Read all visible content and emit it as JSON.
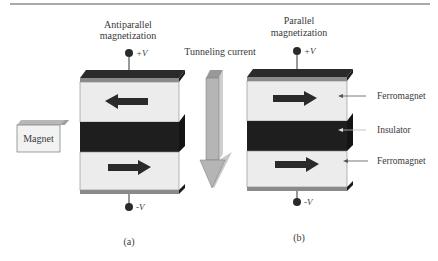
{
  "figure": {
    "panel_a": {
      "title_line1": "Antiparallel",
      "title_line2": "magnetization",
      "top_terminal": "+V",
      "bottom_terminal": "-V",
      "caption": "(a)",
      "top_layer_arrow": "left",
      "bottom_layer_arrow": "right"
    },
    "panel_b": {
      "title_line1": "Parallel",
      "title_line2": "magnetization",
      "top_terminal": "+V",
      "bottom_terminal": "-V",
      "caption": "(b)",
      "top_layer_arrow": "right",
      "bottom_layer_arrow": "right"
    },
    "tunneling_label": "Tunneling current",
    "magnet_label": "Magnet",
    "layer_labels": {
      "top": "Ferromagnet",
      "middle": "Insulator",
      "bottom": "Ferromagnet"
    },
    "colors": {
      "ferromagnet": "#ececec",
      "insulator": "#1e1e1e",
      "electrode": "#8a8a8a",
      "arrow": "#2a2a2a",
      "current_arrow": "#b5b5b5"
    }
  }
}
